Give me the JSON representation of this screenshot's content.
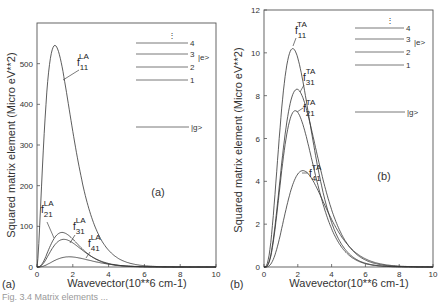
{
  "chart_data": [
    {
      "panel": "(a)",
      "type": "line",
      "xlabel": "Wavevector(10**6 cm-1)",
      "ylabel": "Squared matrix element (Micro eV**2)",
      "xlim": [
        0,
        10
      ],
      "ylim": [
        0,
        600
      ],
      "xticks": [
        0,
        2,
        4,
        6,
        8,
        10
      ],
      "yticks": [
        0,
        100,
        200,
        300,
        400,
        500
      ],
      "grid": false,
      "panel_label": "(a)",
      "corner_label": "(a)",
      "series": [
        {
          "name": "f11 LA",
          "base": "f",
          "sub": "11",
          "sup": "LA",
          "peak_x": 1.0,
          "peak_y": 545,
          "shape": "broad"
        },
        {
          "name": "f21 LA",
          "base": "f",
          "sub": "21",
          "sup": "LA",
          "peak_x": 1.4,
          "peak_y": 85,
          "shape": "narrow"
        },
        {
          "name": "f31 LA",
          "base": "f",
          "sub": "31",
          "sup": "LA",
          "peak_x": 1.5,
          "peak_y": 68,
          "shape": "narrow"
        },
        {
          "name": "f41 LA",
          "base": "f",
          "sub": "41",
          "sup": "LA",
          "peak_x": 1.8,
          "peak_y": 25,
          "shape": "narrow"
        }
      ],
      "inset_levels": {
        "dots": "⋮",
        "levels": [
          "4",
          "3",
          "2",
          "1"
        ],
        "excited_label": "|e>",
        "ground_label": "|g>"
      }
    },
    {
      "panel": "(b)",
      "type": "line",
      "xlabel": "Wavevector(10**6 cm-1)",
      "ylabel": "Squared matrix element (Micro eV**2)",
      "xlim": [
        0,
        10
      ],
      "ylim": [
        0,
        12
      ],
      "xticks": [
        0,
        2,
        4,
        6,
        8,
        10
      ],
      "yticks": [
        0,
        2,
        4,
        6,
        8,
        10,
        12
      ],
      "grid": false,
      "panel_label": "(b)",
      "corner_label": "(b)",
      "series": [
        {
          "name": "f11 TA",
          "base": "f",
          "sub": "11",
          "sup": "TA",
          "peak_x": 1.7,
          "peak_y": 10.2
        },
        {
          "name": "f31 TA",
          "base": "f",
          "sub": "31",
          "sup": "TA",
          "peak_x": 1.95,
          "peak_y": 8.3
        },
        {
          "name": "f21 TA",
          "base": "f",
          "sub": "21",
          "sup": "TA",
          "peak_x": 1.85,
          "peak_y": 7.3
        },
        {
          "name": "f41 TA",
          "base": "f",
          "sub": "41",
          "sup": "TA",
          "peak_x": 2.3,
          "peak_y": 4.5
        }
      ],
      "inset_levels": {
        "dots": "⋮",
        "levels": [
          "4",
          "3",
          "2",
          "1"
        ],
        "excited_label": "|e>",
        "ground_label": "|g>"
      }
    }
  ],
  "caption_fragment": "Fig. 3.4  Matrix elements ..."
}
